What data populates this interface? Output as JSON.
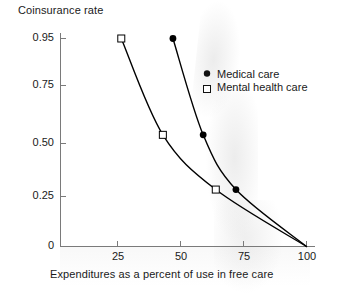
{
  "chart_data": {
    "type": "line",
    "title": "",
    "xlabel": "Expenditures as a percent of use in free care",
    "ylabel": "Coinsurance rate",
    "xlim": [
      0,
      100
    ],
    "ylim": [
      0,
      0.95
    ],
    "xticks": [
      25,
      50,
      75,
      100
    ],
    "xtick_labels": [
      "25",
      "50",
      "75",
      "100"
    ],
    "yticks": [
      0,
      0.25,
      0.5,
      0.75,
      0.95
    ],
    "ytick_labels": [
      "0",
      "0.25",
      "0.50",
      "0.75",
      "0.95"
    ],
    "grid": false,
    "legend_position": "upper right",
    "series": [
      {
        "name": "Medical care",
        "marker": "filled-circle",
        "color": "#000000",
        "points": [
          {
            "x": 47.0,
            "y": 0.95
          },
          {
            "x": 59.0,
            "y": 0.51
          },
          {
            "x": 72.0,
            "y": 0.26
          },
          {
            "x": 100.0,
            "y": 0.0
          }
        ]
      },
      {
        "name": "Mental health care",
        "marker": "open-square",
        "color": "#000000",
        "points": [
          {
            "x": 26.5,
            "y": 0.95
          },
          {
            "x": 43.0,
            "y": 0.51
          },
          {
            "x": 64.0,
            "y": 0.26
          },
          {
            "x": 100.0,
            "y": 0.0
          }
        ]
      }
    ]
  },
  "legend": {
    "items": [
      {
        "label": "Medical care",
        "marker": "filled-circle"
      },
      {
        "label": "Mental health care",
        "marker": "open-square"
      }
    ]
  },
  "axes": {
    "y_title": "Coinsurance rate",
    "x_title": "Expenditures as a percent of use in free care",
    "y_labels": [
      "0.95",
      "0.75",
      "0.50",
      "0.25",
      "0"
    ],
    "x_labels": [
      "25",
      "50",
      "75",
      "100"
    ]
  },
  "colors": {
    "axis": "#7a7a7a",
    "curve": "#111111",
    "text": "#1a1a1a",
    "background": "#ffffff"
  }
}
